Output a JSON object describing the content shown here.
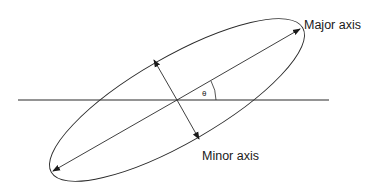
{
  "diagram": {
    "labels": {
      "major_axis": "Major axis",
      "minor_axis": "Minor axis",
      "angle": "θ"
    },
    "geometry": {
      "center": [
        177,
        100
      ],
      "semi_major": 143,
      "semi_minor": 46,
      "rotation_deg": -29.9,
      "horizontal_line": [
        18,
        329
      ],
      "major_axis_endpoints": [
        [
          53,
          171
        ],
        [
          300,
          29
        ]
      ],
      "minor_axis_endpoints": [
        [
          154,
          60
        ],
        [
          199,
          139
        ]
      ]
    },
    "colors": {
      "stroke": "#2a2a2a",
      "text": "#1a1a1a",
      "background": "#ffffff"
    }
  }
}
